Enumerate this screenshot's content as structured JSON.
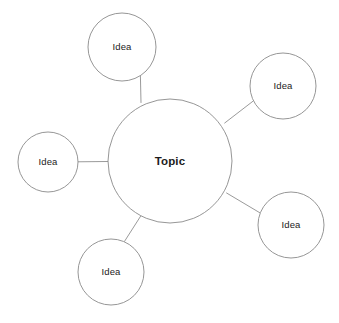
{
  "diagram": {
    "type": "mind-map",
    "background_color": "#ffffff",
    "stroke_color": "#8a8a8a",
    "connector_color": "#8f8f8f",
    "text_color": "#1c1c1c",
    "stroke_width": 0.9,
    "canvas": {
      "width": 339,
      "height": 323
    },
    "central_node": {
      "id": "topic",
      "label": "Topic",
      "cx": 170,
      "cy": 161,
      "r": 62,
      "font_weight": "bold"
    },
    "satellite_nodes": [
      {
        "id": "idea-top",
        "label": "Idea",
        "cx": 122,
        "cy": 47,
        "r": 34,
        "position": "top-left"
      },
      {
        "id": "idea-top-right",
        "label": "Idea",
        "cx": 283,
        "cy": 86,
        "r": 33,
        "position": "top-right"
      },
      {
        "id": "idea-left",
        "label": "Idea",
        "cx": 48,
        "cy": 162,
        "r": 30,
        "position": "left"
      },
      {
        "id": "idea-bottom-right",
        "label": "Idea",
        "cx": 291,
        "cy": 225,
        "r": 33,
        "position": "bottom-right"
      },
      {
        "id": "idea-bottom-left",
        "label": "Idea",
        "cx": 111,
        "cy": 272,
        "r": 33,
        "position": "bottom-left"
      }
    ],
    "connectors": [
      {
        "id": "connector-topic-idea-top",
        "from": "topic",
        "to": "idea-top",
        "x1": 141.0,
        "y1": 102.5,
        "x2": 140.4,
        "y2": 75.8
      },
      {
        "id": "connector-topic-idea-top-right",
        "from": "topic",
        "to": "idea-top-right",
        "x1": 224.7,
        "y1": 123.0,
        "x2": 253.1,
        "y2": 101.1
      },
      {
        "id": "connector-topic-idea-left",
        "from": "topic",
        "to": "idea-left",
        "x1": 108.0,
        "y1": 161.5,
        "x2": 78.0,
        "y2": 161.8
      },
      {
        "id": "connector-topic-idea-bottom-right",
        "from": "topic",
        "to": "idea-bottom-right",
        "x1": 226.6,
        "y1": 193.0,
        "x2": 259.7,
        "y2": 212.7
      },
      {
        "id": "connector-topic-idea-bottom-left",
        "from": "topic",
        "to": "idea-bottom-left",
        "x1": 140.8,
        "y1": 215.9,
        "x2": 124.5,
        "y2": 241.4
      }
    ]
  }
}
